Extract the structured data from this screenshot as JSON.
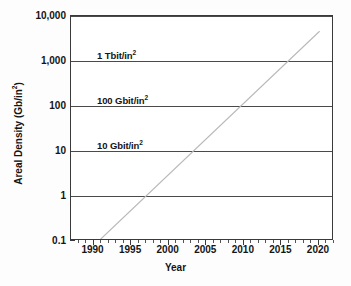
{
  "chart_data": {
    "type": "line",
    "title": "",
    "xlabel": "Year",
    "ylabel": "Areal Density (Gb/in²)",
    "ylabel_text": "Areal Density (Gb/in",
    "ylabel_sup": "2",
    "ylabel_close": ")",
    "xlim": [
      1987,
      2022
    ],
    "ylim": [
      0.1,
      30000
    ],
    "yscale": "log",
    "xscale": "linear",
    "grid": true,
    "grid_orientation": "horizontal",
    "legend": "none",
    "xticks": [
      1990,
      1995,
      2000,
      2005,
      2010,
      2015,
      2020
    ],
    "xtick_labels": [
      "1990",
      "1995",
      "2000",
      "2005",
      "2010",
      "2015",
      "2020"
    ],
    "xtick_minor": [
      1988,
      1989,
      1991,
      1992,
      1993,
      1994,
      1996,
      1997,
      1998,
      1999,
      2001,
      2002,
      2003,
      2004,
      2006,
      2007,
      2008,
      2009,
      2011,
      2012,
      2013,
      2014,
      2016,
      2017,
      2018,
      2019,
      2021,
      2022
    ],
    "yticks": [
      0.1,
      1,
      10,
      100,
      1000,
      10000
    ],
    "ytick_labels": [
      "0.1",
      "1",
      "10",
      "100",
      "1,000",
      "10,000"
    ],
    "gridline_values": [
      1,
      10,
      100,
      1000,
      10000
    ],
    "series": [
      {
        "name": "Areal density trend",
        "style": "dotted",
        "color": "#b9b9b9",
        "x": [
          1991.0,
          1995.0,
          2000.0,
          2005.0,
          2010.0,
          2015.0,
          2020.3
        ],
        "y": [
          0.1,
          0.54,
          4.0,
          29.5,
          218,
          1610,
          12500
        ]
      }
    ],
    "annotations": [
      {
        "text": "10 Tbit/in",
        "sup": "2",
        "x": 1992.4,
        "y": 19000,
        "value_gbit_per_in2": 10000
      },
      {
        "text": "1 Tbit/in",
        "sup": "2",
        "x": 1992.4,
        "y": 2300,
        "value_gbit_per_in2": 1000
      },
      {
        "text": "100 Gbit/in",
        "sup": "2",
        "x": 1992.4,
        "y": 255,
        "value_gbit_per_in2": 100
      },
      {
        "text": "10 Gbit/in",
        "sup": "2",
        "x": 1992.4,
        "y": 26,
        "value_gbit_per_in2": 10
      }
    ]
  },
  "figure": {
    "background_color": "#fdfdfd",
    "plot_background_color": "#ffffff",
    "axis_color": "#3a3a3a",
    "gridline_color": "#4a4a4a",
    "trend_color": "#b9b9b9",
    "text_color": "#141414"
  }
}
